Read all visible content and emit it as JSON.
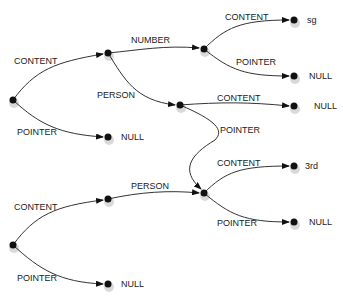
{
  "diagram": {
    "type": "pointer-graph",
    "nodes": [
      {
        "id": "root1",
        "x": 13,
        "y": 100
      },
      {
        "id": "n1",
        "x": 108,
        "y": 53
      },
      {
        "id": "n1_null",
        "x": 108,
        "y": 137,
        "value": "NULL"
      },
      {
        "id": "num",
        "x": 204,
        "y": 49
      },
      {
        "id": "num_sg",
        "x": 294,
        "y": 20,
        "value": "sg"
      },
      {
        "id": "num_null",
        "x": 294,
        "y": 76,
        "value": "NULL"
      },
      {
        "id": "person1",
        "x": 180,
        "y": 105
      },
      {
        "id": "person1_null",
        "x": 294,
        "y": 106,
        "value": "NULL"
      },
      {
        "id": "shared",
        "x": 204,
        "y": 193
      },
      {
        "id": "shared_3rd",
        "x": 294,
        "y": 166,
        "value": "3rd"
      },
      {
        "id": "shared_null",
        "x": 294,
        "y": 222,
        "value": "NULL"
      },
      {
        "id": "root2",
        "x": 13,
        "y": 245
      },
      {
        "id": "n2",
        "x": 108,
        "y": 199
      },
      {
        "id": "n2_null",
        "x": 108,
        "y": 284,
        "value": "NULL"
      }
    ],
    "edges": [
      {
        "from": "root1",
        "to": "n1",
        "label": "CONTENT"
      },
      {
        "from": "root1",
        "to": "n1_null",
        "label": "POINTER"
      },
      {
        "from": "n1",
        "to": "num",
        "label": "NUMBER"
      },
      {
        "from": "n1",
        "to": "person1",
        "label": "PERSON"
      },
      {
        "from": "num",
        "to": "num_sg",
        "label": "CONTENT"
      },
      {
        "from": "num",
        "to": "num_null",
        "label": "POINTER"
      },
      {
        "from": "person1",
        "to": "person1_null",
        "label": "CONTENT"
      },
      {
        "from": "person1",
        "to": "shared",
        "label": "POINTER"
      },
      {
        "from": "root2",
        "to": "n2",
        "label": "CONTENT"
      },
      {
        "from": "root2",
        "to": "n2_null",
        "label": "POINTER"
      },
      {
        "from": "n2",
        "to": "shared",
        "label": "PERSON"
      },
      {
        "from": "shared",
        "to": "shared_3rd",
        "label": "CONTENT"
      },
      {
        "from": "shared",
        "to": "shared_null",
        "label": "POINTER"
      }
    ]
  },
  "labels": {
    "e_root1_content": "CONTENT",
    "e_root1_pointer": "POINTER",
    "e_n1_number": "NUMBER",
    "e_n1_person": "PERSON",
    "e_num_content": "CONTENT",
    "e_num_pointer": "POINTER",
    "e_person1_content": "CONTENT",
    "e_person1_pointer": "POINTER",
    "e_root2_content": "CONTENT",
    "e_root2_pointer": "POINTER",
    "e_n2_person": "PERSON",
    "e_shared_content": "CONTENT",
    "e_shared_pointer": "POINTER"
  },
  "values": {
    "n1_null": "NULL",
    "num_sg": "sg",
    "num_null": "NULL",
    "person1_null": "NULL",
    "shared_3rd": "3rd",
    "shared_null": "NULL",
    "n2_null": "NULL"
  },
  "colors": {
    "edge": "#333333",
    "node": "#111111",
    "text": "#222222",
    "background": "#ffffff"
  }
}
